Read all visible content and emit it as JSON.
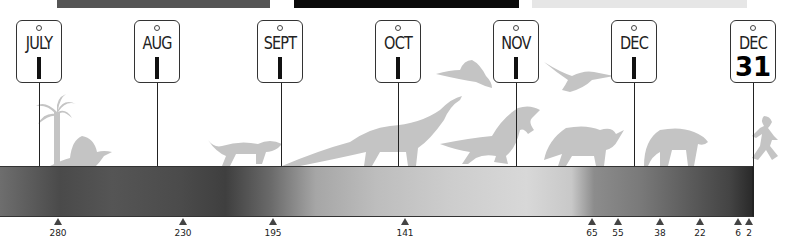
{
  "top_bars": [
    {
      "left": 57,
      "width": 213,
      "color": "#555555"
    },
    {
      "left": 294,
      "width": 225,
      "color": "#0a0a0a"
    },
    {
      "left": 532,
      "width": 215,
      "color": "#e6e6e6"
    }
  ],
  "calendar_tags": [
    {
      "month": "JULY",
      "day": "1",
      "x": 39
    },
    {
      "month": "AUG",
      "day": "1",
      "x": 157
    },
    {
      "month": "SEPT",
      "day": "1",
      "x": 281
    },
    {
      "month": "OCT",
      "day": "1",
      "x": 398
    },
    {
      "month": "NOV",
      "day": "1",
      "x": 516
    },
    {
      "month": "DEC",
      "day": "1",
      "x": 634
    },
    {
      "month": "DEC",
      "day": "31",
      "x": 753
    }
  ],
  "timeline_markers": [
    {
      "label": "280",
      "x": 58
    },
    {
      "label": "230",
      "x": 183
    },
    {
      "label": "195",
      "x": 273
    },
    {
      "label": "141",
      "x": 405
    },
    {
      "label": "65",
      "x": 592
    },
    {
      "label": "55",
      "x": 618
    },
    {
      "label": "38",
      "x": 660
    },
    {
      "label": "22",
      "x": 700
    },
    {
      "label": "6",
      "x": 738
    },
    {
      "label": "2",
      "x": 749
    }
  ],
  "silhouettes": [
    "palm-tree",
    "dimetrodon",
    "early-mammal",
    "sauropod",
    "archaeopteryx",
    "pterosaur",
    "tyrannosaurus",
    "triceratops",
    "large-mammal",
    "running-human"
  ],
  "colors": {
    "silhouette": "#c4c4c4",
    "line": "#222222"
  }
}
